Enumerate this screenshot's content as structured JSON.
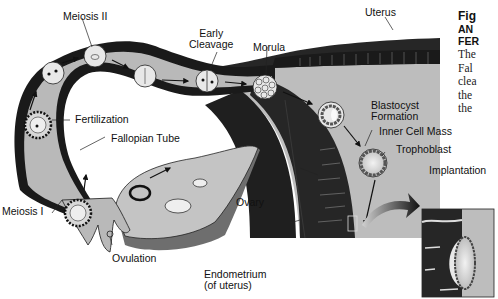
{
  "figure": {
    "title_fragment": "Fig",
    "heading_lines": [
      "AN",
      "FER"
    ],
    "body_lines": [
      "The",
      "Fal",
      "clea",
      "the",
      "the"
    ]
  },
  "labels": {
    "meiosis_ii": "Meiosis II",
    "early_cleavage_1": "Early",
    "early_cleavage_2": "Cleavage",
    "morula": "Morula",
    "uterus": "Uterus",
    "fertilization": "Fertilization",
    "fallopian_tube": "Fallopian Tube",
    "blastocyst_1": "Blastocyst",
    "blastocyst_2": "Formation",
    "inner_cell_mass": "Inner Cell Mass",
    "trophoblast": "Trophoblast",
    "implantation": "Implantation",
    "meiosis_i": "Meiosis I",
    "ovary": "Ovary",
    "ovulation": "Ovulation",
    "endometrium_1": "Endometrium",
    "endometrium_2": "(of uterus)"
  },
  "colors": {
    "background": "#ffffff",
    "tube_fill": "#b9b9b9",
    "tube_wall": "#1a1a1a",
    "uterus_wall": "#262626",
    "uterine_cavity": "#bdbdbd",
    "ovary_fill": "#c4c4c4",
    "ovary_shadow": "#6e6e6e",
    "text": "#111111"
  }
}
